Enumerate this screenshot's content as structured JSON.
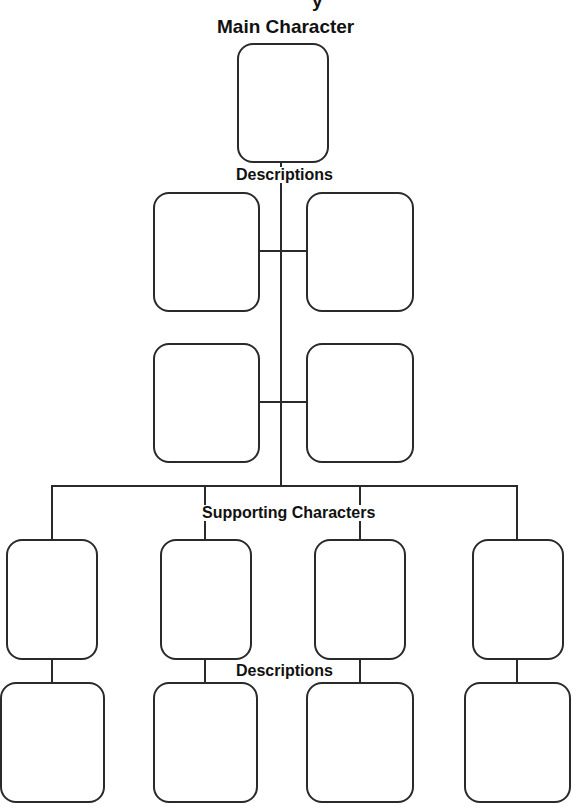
{
  "title_fragment": "y",
  "labels": {
    "main_character": "Main Character",
    "descriptions_top": "Descriptions",
    "supporting_characters": "Supporting Characters",
    "descriptions_bottom": "Descriptions"
  },
  "main_box": {
    "x": 237,
    "y": 43,
    "w": 92,
    "h": 120
  },
  "description_boxes": [
    {
      "x": 153,
      "y": 192,
      "w": 107,
      "h": 120
    },
    {
      "x": 306,
      "y": 192,
      "w": 108,
      "h": 120
    },
    {
      "x": 153,
      "y": 343,
      "w": 107,
      "h": 120
    },
    {
      "x": 306,
      "y": 343,
      "w": 108,
      "h": 120
    }
  ],
  "supporting_boxes": [
    {
      "x": 6,
      "y": 539,
      "w": 92,
      "h": 121
    },
    {
      "x": 160,
      "y": 539,
      "w": 92,
      "h": 121
    },
    {
      "x": 314,
      "y": 539,
      "w": 92,
      "h": 121
    },
    {
      "x": 472,
      "y": 539,
      "w": 92,
      "h": 121
    }
  ],
  "supporting_description_boxes": [
    {
      "x": 0,
      "y": 682,
      "w": 105,
      "h": 121
    },
    {
      "x": 153,
      "y": 682,
      "w": 105,
      "h": 121
    },
    {
      "x": 306,
      "y": 682,
      "w": 108,
      "h": 121
    },
    {
      "x": 464,
      "y": 682,
      "w": 107,
      "h": 121
    }
  ],
  "line_color": "#2a2a2a"
}
